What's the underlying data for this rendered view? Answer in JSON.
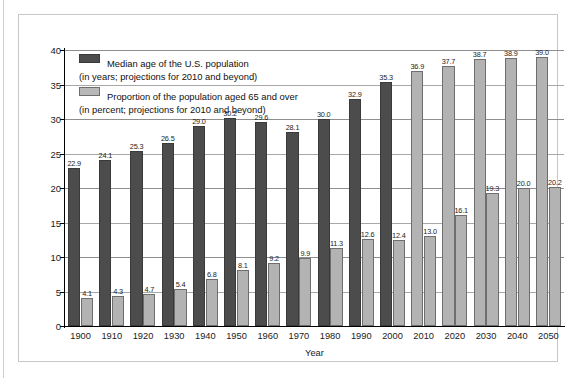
{
  "chart_data": {
    "type": "bar",
    "title": "",
    "xlabel": "Year",
    "ylabel": "",
    "ylim": [
      0,
      40
    ],
    "yticks": [
      0,
      5,
      10,
      15,
      20,
      25,
      30,
      35,
      40
    ],
    "grid": true,
    "legend_position": "upper-left-inside",
    "categories": [
      "1900",
      "1910",
      "1920",
      "1930",
      "1940",
      "1950",
      "1960",
      "1970",
      "1980",
      "1990",
      "2000",
      "2010",
      "2020",
      "2030",
      "2040",
      "2050"
    ],
    "series": [
      {
        "name": "Median age of the U.S. population",
        "unit": "years",
        "color": "#4c4c4c",
        "values": [
          22.9,
          24.1,
          25.3,
          26.5,
          29.0,
          30.2,
          29.6,
          28.1,
          30.0,
          32.9,
          35.3,
          36.9,
          37.7,
          38.7,
          38.9,
          39.0
        ],
        "projected_from": "2010"
      },
      {
        "name": "Proportion of the population aged 65 and over",
        "unit": "percent",
        "color": "#b3b3b3",
        "values": [
          4.1,
          4.3,
          4.7,
          5.4,
          6.8,
          8.1,
          9.2,
          9.9,
          11.3,
          12.6,
          12.4,
          13.0,
          16.1,
          19.3,
          20.0,
          20.2
        ],
        "projected_from": "2010"
      }
    ],
    "annotations": []
  },
  "legend": {
    "items": [
      {
        "swatch": "dark",
        "line1": "Median age of the U.S. population",
        "line2": "(in years; projections for 2010 and beyond)"
      },
      {
        "swatch": "light",
        "line1": "Proportion of the population aged 65 and over",
        "line2": "(in percent; projections for 2010 and beyond)"
      }
    ]
  },
  "colors": {
    "series_dark": "#4c4c4c",
    "series_light": "#b3b3b3",
    "gridline": "#8f8f8f",
    "axis": "#000000",
    "panel_border": "#c8c8c8",
    "background": "#ffffff"
  }
}
